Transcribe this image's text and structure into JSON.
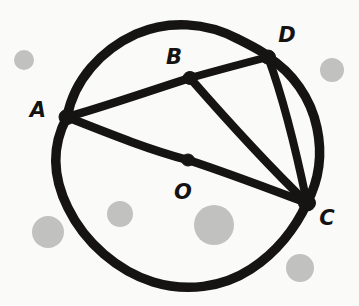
{
  "figure": {
    "kind": "hand-drawn-geometry-diagram",
    "background_color": "#fafaf9",
    "ink_color": "#151413",
    "stroke_width_circle": 9,
    "stroke_width_chord": 8,
    "canvas": {
      "width": 359,
      "height": 306
    }
  },
  "circle": {
    "name": "main-circle",
    "center_x": 187,
    "center_y": 158,
    "radius_x": 133,
    "radius_y": 131
  },
  "points": [
    {
      "id": "A",
      "label": "A",
      "x": 67,
      "y": 117,
      "label_x": 38,
      "label_y": 110,
      "on_circle": true,
      "is_center": false
    },
    {
      "id": "B",
      "label": "B",
      "x": 190,
      "y": 78,
      "label_x": 174,
      "label_y": 57,
      "on_circle": true,
      "is_center": false
    },
    {
      "id": "D",
      "label": "D",
      "x": 268,
      "y": 57,
      "label_x": 287,
      "label_y": 35,
      "on_circle": true,
      "is_center": false
    },
    {
      "id": "C",
      "label": "C",
      "x": 307,
      "y": 203,
      "label_x": 327,
      "label_y": 218,
      "on_circle": true,
      "is_center": false
    },
    {
      "id": "O",
      "label": "O",
      "x": 188,
      "y": 160,
      "label_x": 183,
      "label_y": 192,
      "on_circle": false,
      "is_center": true
    }
  ],
  "segments": [
    {
      "id": "AB",
      "from": "A",
      "to": "B",
      "kind": "chord"
    },
    {
      "id": "BD",
      "from": "B",
      "to": "D",
      "kind": "chord"
    },
    {
      "id": "BC",
      "from": "B",
      "to": "C",
      "kind": "chord"
    },
    {
      "id": "DC",
      "from": "D",
      "to": "C",
      "kind": "chord"
    },
    {
      "id": "AC",
      "from": "A",
      "to": "C",
      "kind": "diameter-through-O"
    }
  ],
  "labels_order": [
    "A",
    "B",
    "D",
    "O",
    "C"
  ]
}
